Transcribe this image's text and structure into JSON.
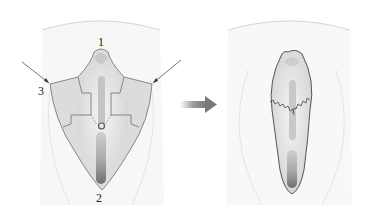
{
  "figure": {
    "panels": [
      {
        "id": "before",
        "description": "Preoperative flap design"
      },
      {
        "id": "after",
        "description": "Postoperative sutured result"
      }
    ],
    "labels": {
      "point1": "1",
      "point2": "2",
      "point3": "3"
    },
    "transition_arrow": "arrow-right",
    "colors": {
      "skin_outline": "#d8d8d8",
      "flap_fill": "#d9d9d9",
      "flap_stroke": "#6a6a6a",
      "inner_light": "#ececec",
      "inner_mid": "#bdbdbd",
      "inner_dark": "#7d7d7d",
      "arrow": "#8a8a8a",
      "suture": "#555555",
      "label": "#222222"
    }
  }
}
